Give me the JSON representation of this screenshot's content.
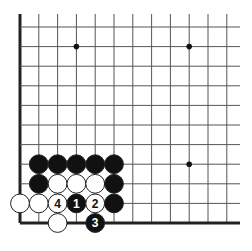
{
  "diagram": {
    "type": "go-board-fragment",
    "colors": {
      "background": "#ffffff",
      "grid_line": "#555555",
      "edge_line": "#222222",
      "black_stone": "#111111",
      "white_stone": "#ffffff",
      "stone_outline": "#222222"
    },
    "grid": {
      "origin_x": 20,
      "origin_y": 223,
      "col_spacing": 18.8,
      "row_spacing": 19.6,
      "cols": 12,
      "rows": 11,
      "extend_right_to": 240,
      "extend_top_to": 14,
      "thick_edges": [
        "left",
        "bottom"
      ]
    },
    "star_points": [
      {
        "col": 3,
        "row": 9
      },
      {
        "col": 9,
        "row": 9
      },
      {
        "col": 9,
        "row": 3
      }
    ],
    "stones": [
      {
        "col": 1,
        "row": 3,
        "color": "black",
        "label": ""
      },
      {
        "col": 2,
        "row": 3,
        "color": "black",
        "label": ""
      },
      {
        "col": 3,
        "row": 3,
        "color": "black",
        "label": ""
      },
      {
        "col": 4,
        "row": 3,
        "color": "black",
        "label": ""
      },
      {
        "col": 5,
        "row": 3,
        "color": "black",
        "label": ""
      },
      {
        "col": 1,
        "row": 2,
        "color": "black",
        "label": ""
      },
      {
        "col": 2,
        "row": 2,
        "color": "white",
        "label": ""
      },
      {
        "col": 3,
        "row": 2,
        "color": "white",
        "label": ""
      },
      {
        "col": 4,
        "row": 2,
        "color": "white",
        "label": ""
      },
      {
        "col": 5,
        "row": 2,
        "color": "black",
        "label": ""
      },
      {
        "col": 0,
        "row": 1,
        "color": "white",
        "label": ""
      },
      {
        "col": 1,
        "row": 1,
        "color": "white",
        "label": ""
      },
      {
        "col": 2,
        "row": 1,
        "color": "white",
        "label": "4"
      },
      {
        "col": 3,
        "row": 1,
        "color": "black",
        "label": "1"
      },
      {
        "col": 4,
        "row": 1,
        "color": "white",
        "label": "2"
      },
      {
        "col": 5,
        "row": 1,
        "color": "black",
        "label": ""
      },
      {
        "col": 2,
        "row": 0,
        "color": "white",
        "label": ""
      },
      {
        "col": 4,
        "row": 0,
        "color": "black",
        "label": "3"
      }
    ],
    "move_labels": [
      "1",
      "2",
      "3",
      "4"
    ]
  }
}
